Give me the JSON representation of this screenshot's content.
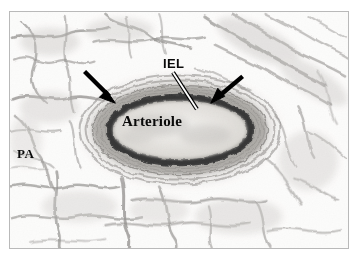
{
  "figure": {
    "kind": "light-microscopy-histology-micrograph",
    "stain_appearance": "grayscale / monochrome",
    "frame_border_color": "#b9b9b9",
    "background_color": "#ffffff"
  },
  "labels": {
    "iel": "IEL",
    "arteriole": "Arteriole",
    "pa": "PA"
  },
  "annotations": {
    "leader_line": {
      "name": "iel-leader-line",
      "style": "white line with black outline",
      "from_x": 173,
      "from_y": 72,
      "to_x": 197,
      "to_y": 109
    },
    "arrows": [
      {
        "name": "left-arrow",
        "color": "#000000",
        "tail_x": 84,
        "tail_y": 71,
        "tip_x": 113,
        "tip_y": 101,
        "points_to": "external elastic lamina / adventitia boundary"
      },
      {
        "name": "right-arrow",
        "color": "#000000",
        "tail_x": 243,
        "tail_y": 76,
        "tip_x": 211,
        "tip_y": 101,
        "points_to": "external elastic lamina / adventitia boundary"
      }
    ]
  },
  "structures": {
    "vessel_center_x": 180,
    "vessel_center_y": 130,
    "adventitia_rx": 103,
    "adventitia_ry": 56,
    "media_rx": 88,
    "media_ry": 45,
    "iel_rx": 72,
    "iel_ry": 34,
    "lumen_rx": 66,
    "lumen_ry": 28,
    "iel_color": "#111111",
    "media_color": "#8d8b88",
    "adventitia_color": "#b5b2ae",
    "lumen_color": "#e9e7e3",
    "alveolar_septa_color": "#6f6d6a"
  }
}
